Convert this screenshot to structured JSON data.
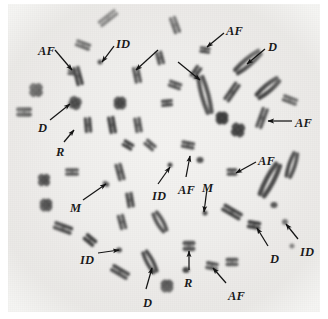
{
  "figure": {
    "background_color": "#efeeec",
    "ink_color": "#3a3a3a",
    "label_color": "#1a1a1a",
    "width": 328,
    "height": 319
  },
  "annotations": [
    {
      "id": "af-top-left",
      "text": "AF",
      "x": 38,
      "y": 45,
      "arrow": {
        "x1": 55,
        "y1": 50,
        "x2": 72,
        "y2": 70
      }
    },
    {
      "id": "id-top-left",
      "text": "ID",
      "x": 116,
      "y": 38,
      "arrow": {
        "x1": 114,
        "y1": 46,
        "x2": 102,
        "y2": 62
      }
    },
    {
      "id": "af-top-right",
      "text": "AF",
      "x": 226,
      "y": 25,
      "arrow": {
        "x1": 224,
        "y1": 33,
        "x2": 207,
        "y2": 47
      }
    },
    {
      "id": "d-top-right",
      "text": "D",
      "x": 268,
      "y": 41,
      "arrow": {
        "x1": 265,
        "y1": 49,
        "x2": 247,
        "y2": 64
      }
    },
    {
      "id": "arrow-unlabeled-1",
      "text": "",
      "x": 0,
      "y": 0,
      "arrow": {
        "x1": 158,
        "y1": 50,
        "x2": 136,
        "y2": 70
      }
    },
    {
      "id": "arrow-unlabeled-2",
      "text": "",
      "x": 0,
      "y": 0,
      "arrow": {
        "x1": 178,
        "y1": 62,
        "x2": 200,
        "y2": 80
      }
    },
    {
      "id": "d-left",
      "text": "D",
      "x": 38,
      "y": 122,
      "arrow": {
        "x1": 50,
        "y1": 120,
        "x2": 70,
        "y2": 104
      }
    },
    {
      "id": "r-left",
      "text": "R",
      "x": 56,
      "y": 146,
      "arrow": {
        "x1": 64,
        "y1": 142,
        "x2": 74,
        "y2": 130
      }
    },
    {
      "id": "af-right-upper",
      "text": "AF",
      "x": 295,
      "y": 117,
      "arrow": {
        "x1": 292,
        "y1": 121,
        "x2": 268,
        "y2": 121
      }
    },
    {
      "id": "af-right-lower",
      "text": "AF",
      "x": 258,
      "y": 155,
      "arrow": {
        "x1": 256,
        "y1": 162,
        "x2": 236,
        "y2": 173
      }
    },
    {
      "id": "m-left",
      "text": "M",
      "x": 70,
      "y": 202,
      "arrow": {
        "x1": 83,
        "y1": 200,
        "x2": 106,
        "y2": 184
      }
    },
    {
      "id": "id-center",
      "text": "ID",
      "x": 152,
      "y": 190,
      "arrow": {
        "x1": 158,
        "y1": 184,
        "x2": 170,
        "y2": 167
      }
    },
    {
      "id": "af-center",
      "text": "AF",
      "x": 178,
      "y": 184,
      "arrow": {
        "x1": 186,
        "y1": 177,
        "x2": 190,
        "y2": 156
      }
    },
    {
      "id": "m-center",
      "text": "M",
      "x": 202,
      "y": 182,
      "arrow": {
        "x1": 207,
        "y1": 189,
        "x2": 204,
        "y2": 212
      }
    },
    {
      "id": "id-bottom-left",
      "text": "ID",
      "x": 80,
      "y": 254,
      "arrow": {
        "x1": 98,
        "y1": 253,
        "x2": 119,
        "y2": 250
      }
    },
    {
      "id": "d-bottom-center",
      "text": "D",
      "x": 143,
      "y": 297,
      "arrow": {
        "x1": 146,
        "y1": 289,
        "x2": 152,
        "y2": 268
      }
    },
    {
      "id": "r-bottom-center",
      "text": "R",
      "x": 184,
      "y": 277,
      "arrow": {
        "x1": 189,
        "y1": 270,
        "x2": 189,
        "y2": 251
      }
    },
    {
      "id": "af-bottom-right",
      "text": "AF",
      "x": 228,
      "y": 290,
      "arrow": {
        "x1": 226,
        "y1": 283,
        "x2": 213,
        "y2": 268
      }
    },
    {
      "id": "d-bottom-right",
      "text": "D",
      "x": 270,
      "y": 253,
      "arrow": {
        "x1": 268,
        "y1": 246,
        "x2": 257,
        "y2": 228
      }
    },
    {
      "id": "id-bottom-right",
      "text": "ID",
      "x": 300,
      "y": 246,
      "arrow": {
        "x1": 298,
        "y1": 239,
        "x2": 286,
        "y2": 224
      }
    }
  ],
  "chromosomes": [
    {
      "cx": 108,
      "cy": 18,
      "len": 22,
      "w": 8,
      "rot": -38,
      "type": "pair"
    },
    {
      "cx": 175,
      "cy": 25,
      "len": 18,
      "w": 8,
      "rot": 70,
      "type": "pair"
    },
    {
      "cx": 83,
      "cy": 45,
      "len": 16,
      "w": 8,
      "rot": 20,
      "type": "pair"
    },
    {
      "cx": 205,
      "cy": 50,
      "len": 11,
      "w": 7,
      "rot": 8,
      "type": "pair"
    },
    {
      "cx": 78,
      "cy": 76,
      "len": 20,
      "w": 8,
      "rot": 75,
      "type": "pair"
    },
    {
      "cx": 137,
      "cy": 75,
      "len": 17,
      "w": 8,
      "rot": 78,
      "type": "pair"
    },
    {
      "cx": 100,
      "cy": 62,
      "len": 5,
      "w": 5,
      "rot": 0,
      "type": "dot"
    },
    {
      "cx": 72,
      "cy": 72,
      "len": 9,
      "w": 7,
      "rot": 5,
      "type": "pair"
    },
    {
      "cx": 248,
      "cy": 62,
      "len": 30,
      "w": 10,
      "rot": -40,
      "type": "long"
    },
    {
      "cx": 268,
      "cy": 88,
      "len": 26,
      "w": 10,
      "rot": -40,
      "type": "long"
    },
    {
      "cx": 175,
      "cy": 85,
      "len": 14,
      "w": 8,
      "rot": 20,
      "type": "pair"
    },
    {
      "cx": 205,
      "cy": 95,
      "len": 36,
      "w": 10,
      "rot": 75,
      "type": "long"
    },
    {
      "cx": 232,
      "cy": 92,
      "len": 22,
      "w": 8,
      "rot": -55,
      "type": "pair"
    },
    {
      "cx": 36,
      "cy": 90,
      "len": 11,
      "w": 9,
      "rot": 0,
      "type": "X"
    },
    {
      "cx": 24,
      "cy": 112,
      "len": 16,
      "w": 10,
      "rot": 0,
      "type": "pair"
    },
    {
      "cx": 75,
      "cy": 103,
      "len": 10,
      "w": 9,
      "rot": 20,
      "type": "X"
    },
    {
      "cx": 120,
      "cy": 103,
      "len": 10,
      "w": 9,
      "rot": 0,
      "type": "X"
    },
    {
      "cx": 167,
      "cy": 103,
      "len": 12,
      "w": 8,
      "rot": -5,
      "type": "pair"
    },
    {
      "cx": 88,
      "cy": 125,
      "len": 16,
      "w": 8,
      "rot": 85,
      "type": "pair"
    },
    {
      "cx": 112,
      "cy": 125,
      "len": 18,
      "w": 8,
      "rot": 80,
      "type": "pair"
    },
    {
      "cx": 138,
      "cy": 125,
      "len": 16,
      "w": 8,
      "rot": 80,
      "type": "pair"
    },
    {
      "cx": 262,
      "cy": 118,
      "len": 22,
      "w": 8,
      "rot": -70,
      "type": "pair"
    },
    {
      "cx": 290,
      "cy": 100,
      "len": 16,
      "w": 8,
      "rot": 20,
      "type": "pair"
    },
    {
      "cx": 238,
      "cy": 130,
      "len": 11,
      "w": 9,
      "rot": 10,
      "type": "X"
    },
    {
      "cx": 128,
      "cy": 145,
      "len": 12,
      "w": 8,
      "rot": 30,
      "type": "pair"
    },
    {
      "cx": 150,
      "cy": 145,
      "len": 13,
      "w": 8,
      "rot": 40,
      "type": "pair"
    },
    {
      "cx": 188,
      "cy": 145,
      "len": 14,
      "w": 8,
      "rot": 10,
      "type": "pair"
    },
    {
      "cx": 200,
      "cy": 160,
      "len": 7,
      "w": 6,
      "rot": 0,
      "type": "dot"
    },
    {
      "cx": 170,
      "cy": 165,
      "len": 5,
      "w": 5,
      "rot": 0,
      "type": "dot"
    },
    {
      "cx": 222,
      "cy": 118,
      "len": 10,
      "w": 9,
      "rot": 0,
      "type": "X"
    },
    {
      "cx": 72,
      "cy": 172,
      "len": 14,
      "w": 8,
      "rot": 0,
      "type": "pair"
    },
    {
      "cx": 120,
      "cy": 172,
      "len": 18,
      "w": 8,
      "rot": 75,
      "type": "pair"
    },
    {
      "cx": 232,
      "cy": 172,
      "len": 11,
      "w": 8,
      "rot": 0,
      "type": "pair"
    },
    {
      "cx": 270,
      "cy": 180,
      "len": 34,
      "w": 11,
      "rot": -62,
      "type": "long"
    },
    {
      "cx": 292,
      "cy": 165,
      "len": 24,
      "w": 9,
      "rot": -72,
      "type": "long"
    },
    {
      "cx": 106,
      "cy": 184,
      "len": 7,
      "w": 5,
      "rot": 30,
      "type": "dot"
    },
    {
      "cx": 46,
      "cy": 205,
      "len": 10,
      "w": 9,
      "rot": 0,
      "type": "X"
    },
    {
      "cx": 130,
      "cy": 200,
      "len": 16,
      "w": 8,
      "rot": 80,
      "type": "pair"
    },
    {
      "cx": 63,
      "cy": 228,
      "len": 20,
      "w": 9,
      "rot": 20,
      "type": "pair"
    },
    {
      "cx": 90,
      "cy": 240,
      "len": 14,
      "w": 9,
      "rot": 40,
      "type": "pair"
    },
    {
      "cx": 122,
      "cy": 222,
      "len": 16,
      "w": 8,
      "rot": 75,
      "type": "pair"
    },
    {
      "cx": 160,
      "cy": 222,
      "len": 20,
      "w": 9,
      "rot": 60,
      "type": "long"
    },
    {
      "cx": 205,
      "cy": 213,
      "len": 5,
      "w": 5,
      "rot": 0,
      "type": "dot"
    },
    {
      "cx": 232,
      "cy": 212,
      "len": 22,
      "w": 9,
      "rot": 30,
      "type": "pair"
    },
    {
      "cx": 254,
      "cy": 225,
      "len": 14,
      "w": 9,
      "rot": 10,
      "type": "pair"
    },
    {
      "cx": 285,
      "cy": 222,
      "len": 6,
      "w": 6,
      "rot": 0,
      "type": "dot"
    },
    {
      "cx": 274,
      "cy": 205,
      "len": 7,
      "w": 6,
      "rot": 0,
      "type": "dot"
    },
    {
      "cx": 119,
      "cy": 250,
      "len": 6,
      "w": 5,
      "rot": 0,
      "type": "dot"
    },
    {
      "cx": 150,
      "cy": 262,
      "len": 22,
      "w": 9,
      "rot": 62,
      "type": "long"
    },
    {
      "cx": 120,
      "cy": 272,
      "len": 20,
      "w": 9,
      "rot": 30,
      "type": "pair"
    },
    {
      "cx": 189,
      "cy": 246,
      "len": 13,
      "w": 11,
      "rot": 0,
      "type": "pair"
    },
    {
      "cx": 212,
      "cy": 266,
      "len": 13,
      "w": 9,
      "rot": 10,
      "type": "pair"
    },
    {
      "cx": 232,
      "cy": 262,
      "len": 13,
      "w": 9,
      "rot": 0,
      "type": "pair"
    },
    {
      "cx": 167,
      "cy": 286,
      "len": 10,
      "w": 9,
      "rot": 0,
      "type": "X"
    },
    {
      "cx": 186,
      "cy": 270,
      "len": 7,
      "w": 6,
      "rot": 0,
      "type": "dot"
    },
    {
      "cx": 44,
      "cy": 180,
      "len": 10,
      "w": 8,
      "rot": 0,
      "type": "X"
    },
    {
      "cx": 160,
      "cy": 58,
      "len": 14,
      "w": 8,
      "rot": 75,
      "type": "pair"
    },
    {
      "cx": 196,
      "cy": 72,
      "len": 14,
      "w": 8,
      "rot": -55,
      "type": "pair"
    },
    {
      "cx": 292,
      "cy": 246,
      "len": 5,
      "w": 5,
      "rot": 0,
      "type": "dot"
    }
  ]
}
